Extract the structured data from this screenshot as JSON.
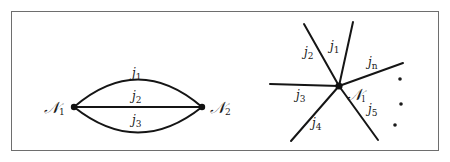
{
  "panels": [
    {
      "id": "left",
      "description": "Two nodes connected by three parallel edges",
      "nodes": [
        {
          "id": "N1",
          "label_main": "𝒩",
          "label_sub": "1"
        },
        {
          "id": "N2",
          "label_main": "𝒩",
          "label_sub": "2"
        }
      ],
      "edges": [
        {
          "id": "j1",
          "label_main": "j",
          "label_sub": "1",
          "shape": "upper-arc"
        },
        {
          "id": "j2",
          "label_main": "j",
          "label_sub": "2",
          "shape": "straight"
        },
        {
          "id": "j3",
          "label_main": "j",
          "label_sub": "3",
          "shape": "lower-arc"
        }
      ]
    },
    {
      "id": "right",
      "description": "Single node with n incident edges (star)",
      "center_node": {
        "id": "Nl",
        "label_main": "𝒩",
        "label_sub": "l"
      },
      "edges": [
        {
          "id": "j1",
          "label_main": "j",
          "label_sub": "1"
        },
        {
          "id": "j2",
          "label_main": "j",
          "label_sub": "2"
        },
        {
          "id": "j3",
          "label_main": "j",
          "label_sub": "3"
        },
        {
          "id": "j4",
          "label_main": "j",
          "label_sub": "4"
        },
        {
          "id": "j5",
          "label_main": "j",
          "label_sub": "5"
        },
        {
          "id": "jn",
          "label_main": "j",
          "label_sub": "n"
        }
      ],
      "ellipsis": "vertical dots indicating more edges"
    }
  ]
}
